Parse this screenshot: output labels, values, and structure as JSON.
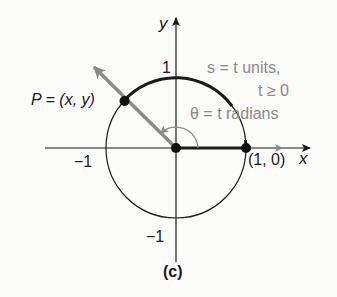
{
  "figure": {
    "caption": "(c)",
    "axes": {
      "x_label": "x",
      "y_label": "y",
      "tick_y_pos": "1",
      "tick_y_neg": "−1",
      "tick_x_neg": "−1"
    },
    "points": {
      "P_label": "P = (x, y)",
      "unit_point_label": "(1, 0)"
    },
    "annotations": {
      "arc_length_line1": "s = t units,",
      "arc_length_line2": "t ≥ 0",
      "angle_label": "θ = t radians"
    },
    "colors": {
      "ink": "#1a1a1a",
      "gray": "#8a8a8a",
      "background": "#fbfbf9"
    }
  }
}
